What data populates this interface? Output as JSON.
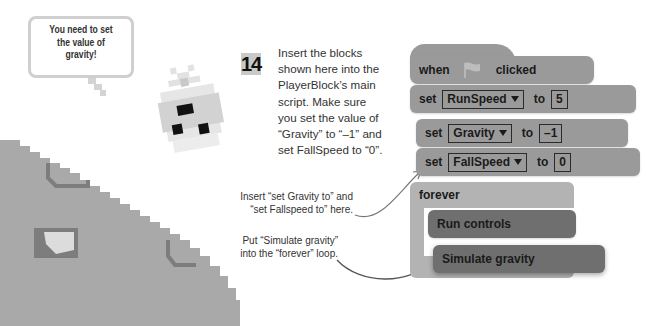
{
  "speech_bubble": {
    "lines": [
      "You need to set",
      "the value of",
      "gravity!"
    ]
  },
  "instruction": {
    "step_number": "14",
    "lines": [
      "Insert the blocks",
      "shown here into the",
      "PlayerBlock’s main",
      "script. Make sure",
      "you set the value of",
      "“Gravity” to “–1” and",
      "set FallSpeed to “0”."
    ]
  },
  "annotations": [
    {
      "lines": [
        "Insert “set Gravity to” and",
        "“set Fallspeed to” here."
      ]
    },
    {
      "lines": [
        "Put “Simulate gravity”",
        "into the “forever” loop."
      ]
    }
  ],
  "script": {
    "hat": {
      "word1": "when",
      "icon": "green-flag-icon",
      "word2": "clicked"
    },
    "blocks": [
      {
        "kind": "set",
        "verb": "set",
        "variable": "RunSpeed",
        "to": "to",
        "value": "5"
      },
      {
        "kind": "set",
        "verb": "set",
        "variable": "Gravity",
        "to": "to",
        "value": "–1"
      },
      {
        "kind": "set",
        "verb": "set",
        "variable": "FallSpeed",
        "to": "to",
        "value": "0"
      }
    ],
    "loop": {
      "label": "forever",
      "inner": [
        "Run controls",
        "Simulate gravity"
      ]
    }
  },
  "colors": {
    "block": "#9a9a9a",
    "custom_block": "#6f6f6f",
    "loop_block": "#b3b3b3",
    "ground": "#a9a9a9",
    "ground_edge": "#7d7d7d",
    "step_badge": "#c9c9c9"
  }
}
